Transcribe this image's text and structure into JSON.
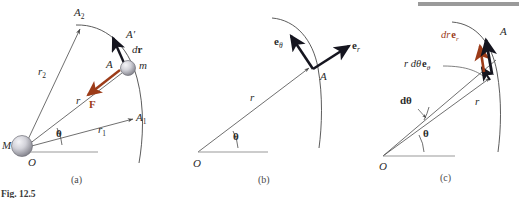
{
  "figure": {
    "caption": "Fig. 12.5",
    "panels": [
      {
        "id": "a",
        "caption": "(a)"
      },
      {
        "id": "b",
        "caption": "(b)"
      },
      {
        "id": "c",
        "caption": "(c)"
      }
    ]
  },
  "colors": {
    "line": "#4a4a4a",
    "vector_black": "#15151f",
    "vector_red": "#9c3b18",
    "label_red": "#9c3b18",
    "sphere_light": "#e8e8ec",
    "sphere_dark": "#8a8a92",
    "axis_gray": "#9a9a9a",
    "caption": "#4a4a4a"
  },
  "panel_a": {
    "labels": {
      "A2": {
        "base": "A",
        "sub": "2"
      },
      "A1": {
        "base": "A",
        "sub": "1"
      },
      "A_prime": "A′",
      "A": "A",
      "m": "m",
      "M": "M",
      "O": "O",
      "r": "r",
      "r1": {
        "base": "r",
        "sub": "1"
      },
      "r2": {
        "base": "r",
        "sub": "2"
      },
      "theta": "θ",
      "dr_vector": "d",
      "dr_vector_bold": "r",
      "force": "F"
    }
  },
  "panel_b": {
    "labels": {
      "e_theta_base": "e",
      "e_theta_sub": "θ",
      "e_r_base": "e",
      "e_r_sub": "r",
      "A": "A",
      "O": "O",
      "r": "r",
      "theta": "θ"
    }
  },
  "panel_c": {
    "labels": {
      "dr_er_prefix": "dr",
      "dr_er_base": "e",
      "dr_er_sub": "r",
      "rdtheta_prefix": "r dθ",
      "rdtheta_base": "e",
      "rdtheta_sub": "θ",
      "A": "A",
      "O": "O",
      "r": "r",
      "theta": "θ",
      "dtheta": "dθ"
    }
  }
}
